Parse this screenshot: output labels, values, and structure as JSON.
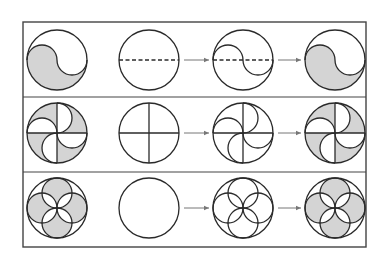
{
  "diagram": {
    "title": "",
    "colors": {
      "stroke": "#2a2a2a",
      "fill_shaded": "#d4d4d4",
      "frame": "#444444",
      "arrow": "#777777",
      "background": "#ffffff"
    },
    "frame": {
      "x": 23,
      "y": 22,
      "width": 343,
      "height": 225
    },
    "row_dividers_y": [
      97,
      172
    ],
    "columns_x": [
      57,
      149,
      243,
      335
    ],
    "radius": 30,
    "rows": [
      {
        "name": "yin-yang",
        "center_y": 60,
        "panels": [
          "shaded-result",
          "circle-with-dashed-diameter",
          "s-curve-construction",
          "shaded-result"
        ]
      },
      {
        "name": "pinwheel",
        "center_y": 133,
        "panels": [
          "shaded-result",
          "circle-with-cross",
          "pinwheel-construction",
          "shaded-result"
        ]
      },
      {
        "name": "four-petal-flower",
        "center_y": 208,
        "panels": [
          "shaded-result",
          "blank-circle",
          "four-circle-construction",
          "shaded-result"
        ]
      }
    ],
    "arrows": [
      {
        "row": 0,
        "from_x": 183,
        "to_x": 209
      },
      {
        "row": 0,
        "from_x": 277,
        "to_x": 301
      },
      {
        "row": 1,
        "from_x": 183,
        "to_x": 209
      },
      {
        "row": 1,
        "from_x": 277,
        "to_x": 301
      },
      {
        "row": 2,
        "from_x": 183,
        "to_x": 209
      },
      {
        "row": 2,
        "from_x": 277,
        "to_x": 301
      }
    ]
  }
}
